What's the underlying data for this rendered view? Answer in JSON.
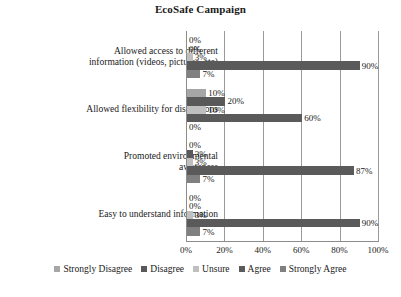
{
  "chart_data": {
    "type": "bar",
    "orientation": "horizontal",
    "grouped": true,
    "title": "EcoSafe Campaign",
    "xlabel": "",
    "ylabel": "",
    "xlim": [
      0,
      100
    ],
    "xticks": [
      "0%",
      "20%",
      "40%",
      "60%",
      "80%",
      "100%"
    ],
    "xtick_values": [
      0,
      20,
      40,
      60,
      80,
      100
    ],
    "grid": true,
    "grid_axis": "x",
    "legend_position": "bottom",
    "value_suffix": "%",
    "categories": [
      "Allowed access to different information (videos, pictures, etc)",
      "Allowed flexibility for discussions",
      "Promoted environmental awareness",
      "Easy to understand information"
    ],
    "category_lines": [
      [
        "Allowed access to different",
        "information (videos, pictures, etc)"
      ],
      [
        "Allowed flexibility for discussions"
      ],
      [
        "Promoted environmental",
        "awareness"
      ],
      [
        "Easy to understand information"
      ]
    ],
    "series": [
      {
        "name": "Strongly Disagree",
        "color": "#a6a6a6",
        "values": [
          0,
          10,
          0,
          0
        ],
        "labels": [
          "0%",
          "10%",
          "0%",
          "0%"
        ]
      },
      {
        "name": "Disagree",
        "color": "#595959",
        "values": [
          0,
          20,
          3,
          0
        ],
        "labels": [
          "0%",
          "20%",
          "3%",
          "0%"
        ]
      },
      {
        "name": "Unsure",
        "color": "#bfbfbf",
        "values": [
          3,
          10,
          3,
          3
        ],
        "labels": [
          "3%",
          "10%",
          "3%",
          "3%"
        ]
      },
      {
        "name": "Agree",
        "color": "#5a5a5a",
        "values": [
          90,
          60,
          87,
          90
        ],
        "labels": [
          "90%",
          "60%",
          "87%",
          "90%"
        ]
      },
      {
        "name": "Strongly Agree",
        "color": "#808080",
        "values": [
          7,
          0,
          7,
          7
        ],
        "labels": [
          "7%",
          "0%",
          "7%",
          "7%"
        ]
      }
    ]
  },
  "colors": {
    "background": "#ffffff",
    "text": "#1a1a1a",
    "gridline": "#9a9a9a",
    "axis": "#8c8c8c"
  }
}
